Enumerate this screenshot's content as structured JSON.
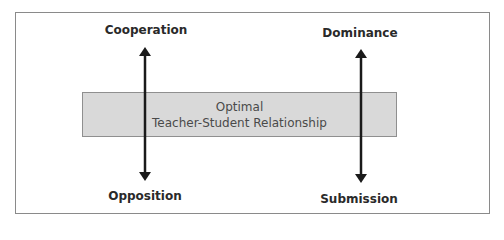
{
  "diagram": {
    "left_axis": {
      "top_label": "Cooperation",
      "bottom_label": "Opposition"
    },
    "right_axis": {
      "top_label": "Dominance",
      "bottom_label": "Submission"
    },
    "center_band": {
      "line1": "Optimal",
      "line2": "Teacher-Student Relationship"
    },
    "colors": {
      "band_fill": "#d9d9d9",
      "arrow": "#1a1a1a",
      "frame": "#8a8a8a"
    }
  }
}
